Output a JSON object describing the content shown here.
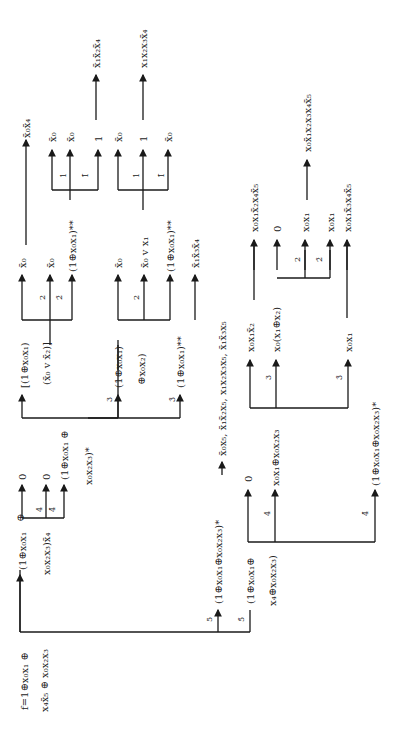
{
  "diagram": {
    "orientation": "rotated 90° counter-clockwise",
    "root": {
      "label_line1": "f=1⊕x₀x₁ ⊕",
      "label_line2": "x₄x̄₅ ⊕ x₀x₂x₃"
    },
    "branch_5": {
      "edge_label": "5",
      "node_line1": "(1⊕x₀x₁⊕x₀x₂x₃)*",
      "target": "x̄₀x₅, x̄₁x̄₂x₅, x₁x₂x₃x₅, x̄₁x̄₃x₅",
      "sub": {
        "edge_3": "3",
        "edge_3bar": "3̄",
        "leaf_a": "x₀x₁x̄₂",
        "leaf_b": "x₀(x₁⊕x₂)",
        "leaf_c": "x₀x₁",
        "edge_2": "2",
        "edge_2bar": "2̄",
        "out_a": "x₀x₁x̄₂x₄x̄₅",
        "out_b": "0",
        "out_c": "x₀x₁",
        "out_d": "x₀x₁",
        "out_e": "x₀x̄₁x₂x₃x₄x̄₅",
        "out_f": "x₀x₁x̄₃x₄x̄₅"
      }
    },
    "branch_5bar": {
      "edge_label": "5̄",
      "node_line1": "(1⊕x₀x₁⊕",
      "node_line2": "x₄⊕x₀x₂x₃)",
      "edge_4": "4",
      "edge_4bar": "4̄",
      "leaf_0": "0",
      "leaf_mid": "x₀x₁⊕x₀x₂x₃",
      "leaf_bottom": "(1⊕x₀x₁⊕x₀x₂x₃)*"
    },
    "upper": {
      "node_line1": "(1⊕x₀x₁",
      "node_line2": "x₀x₂x₃)x̄₄",
      "circle_plus": "⊕",
      "edge_4": "4",
      "edge_4bar": "4̄",
      "leaf_0a": "0",
      "leaf_0b": "0",
      "leaf_c1": "(1⊕x₀x₁ ⊕",
      "leaf_c2": "x₀x₂x₃)*",
      "edge_3": "3",
      "edge_3bar": "3̄",
      "n3_line1": "[(1⊕x₀x₁)",
      "n3_line2": "(x̄₀ v x̄₂)]",
      "n3b_line1": "(1⊕x₀x₁)",
      "n3b_line2": "⊕x₀x₂)",
      "n3c": "(1⊕x₀x₁)**",
      "edge_2": "2",
      "edge_2bar": "2̄",
      "top_a": "x̄₀",
      "top_b": "x̄₀",
      "top_c": "(1⊕x₀x₁)**",
      "edge_1": "1",
      "edge_1bar": "1̄",
      "r_a": "x̄₀x̄₄",
      "r_b": "x̄₀",
      "r_c": "x̄₀",
      "r_d": "1",
      "r_out": "x̄₁x̄₂x̄₄",
      "mid_a": "x̄₀",
      "mid_b": "x̄₀ v x₁",
      "mid_c": "(1⊕x₀x₁)**",
      "mid_d": "x̄₁x̄₃x̄₄",
      "m_r_a": "x̄₀",
      "m_r_b": "1",
      "m_r_c": "x̄₀",
      "m_out": "x₁x₂x₃x̄₄"
    }
  }
}
